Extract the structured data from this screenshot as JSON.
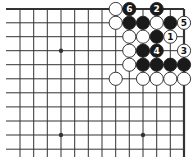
{
  "board": {
    "width": 195,
    "height": 164,
    "columns_x": [
      20,
      33.7,
      47.3,
      61,
      74.7,
      88.3,
      102,
      115.7,
      129.3,
      143,
      156.7,
      170.3,
      184
    ],
    "rows_y": [
      9,
      22.8,
      36.7,
      50.7,
      64.7,
      78.8,
      92.8,
      106.9,
      121,
      135,
      149.2
    ],
    "line_left_extent": 6,
    "line_bottom_extent": 157,
    "top_edge": true,
    "right_edge": true,
    "line_color": "#333333",
    "edge_width": 2.2,
    "line_width": 1,
    "stone_radius": 6.6
  },
  "star_points": [
    {
      "col": 3,
      "row": 3
    },
    {
      "col": 3,
      "row": 9
    },
    {
      "col": 9,
      "row": 9
    }
  ],
  "stones": [
    {
      "col": 7,
      "row": 0,
      "color": "white"
    },
    {
      "col": 8,
      "row": 0,
      "color": "black",
      "label": "6"
    },
    {
      "col": 10,
      "row": 0,
      "color": "black",
      "label": "2"
    },
    {
      "col": 7,
      "row": 1,
      "color": "white"
    },
    {
      "col": 8,
      "row": 1,
      "color": "black"
    },
    {
      "col": 9,
      "row": 1,
      "color": "black"
    },
    {
      "col": 10,
      "row": 1,
      "color": "white"
    },
    {
      "col": 11,
      "row": 1,
      "color": "black"
    },
    {
      "col": 12,
      "row": 1,
      "color": "white",
      "label": "5"
    },
    {
      "col": 8,
      "row": 2,
      "color": "white"
    },
    {
      "col": 9,
      "row": 2,
      "color": "white"
    },
    {
      "col": 10,
      "row": 2,
      "color": "black"
    },
    {
      "col": 11,
      "row": 2,
      "color": "white",
      "label": "1"
    },
    {
      "col": 8,
      "row": 3,
      "color": "white"
    },
    {
      "col": 9,
      "row": 3,
      "color": "black"
    },
    {
      "col": 10,
      "row": 3,
      "color": "black",
      "label": "4"
    },
    {
      "col": 12,
      "row": 3,
      "color": "white",
      "label": "3"
    },
    {
      "col": 8,
      "row": 4,
      "color": "white"
    },
    {
      "col": 9,
      "row": 4,
      "color": "black"
    },
    {
      "col": 10,
      "row": 4,
      "color": "black"
    },
    {
      "col": 11,
      "row": 4,
      "color": "black"
    },
    {
      "col": 12,
      "row": 4,
      "color": "black"
    },
    {
      "col": 7,
      "row": 5,
      "color": "white"
    },
    {
      "col": 9,
      "row": 5,
      "color": "white"
    },
    {
      "col": 10,
      "row": 5,
      "color": "white"
    },
    {
      "col": 11,
      "row": 5,
      "color": "white"
    },
    {
      "col": 12,
      "row": 5,
      "color": "white"
    }
  ],
  "colors": {
    "black_stone": "#1a1a1a",
    "white_stone": "#ffffff",
    "stone_outline": "#222222",
    "label_on_black": "#ffffff",
    "label_on_white": "#111111",
    "background": "#ffffff"
  }
}
